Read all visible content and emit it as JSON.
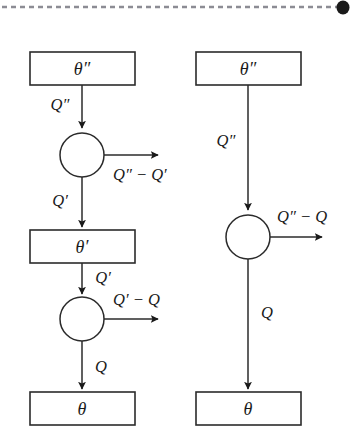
{
  "figure": {
    "background_color": "#ffffff",
    "stroke_color": "#2b2b2b",
    "rule_color": "#8c8c94"
  },
  "top_rule": {
    "style": "dashed",
    "end_marker": "filled-blob"
  },
  "left_diagram": {
    "name": "two-stage-cascade",
    "reservoir_top": "θ″",
    "reservoir_middle": "θ′",
    "reservoir_bottom": "θ",
    "engine_upper_input": "Q″",
    "engine_upper_work": "Q″ − Q′",
    "engine_upper_output": "Q′",
    "engine_lower_input": "Q′",
    "engine_lower_work": "Q′ − Q",
    "engine_lower_output": "Q"
  },
  "right_diagram": {
    "name": "single-stage-engine",
    "reservoir_top": "θ″",
    "reservoir_bottom": "θ",
    "engine_input": "Q″",
    "engine_work": "Q″ − Q",
    "engine_output": "Q"
  }
}
